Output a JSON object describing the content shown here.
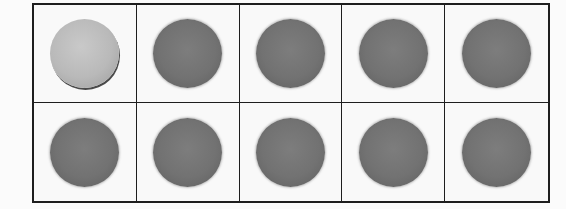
{
  "ten_frame": {
    "rows": 2,
    "columns": 5,
    "cells": [
      {
        "row": 1,
        "col": 1,
        "counter": "light"
      },
      {
        "row": 1,
        "col": 2,
        "counter": "dark"
      },
      {
        "row": 1,
        "col": 3,
        "counter": "dark"
      },
      {
        "row": 1,
        "col": 4,
        "counter": "dark"
      },
      {
        "row": 1,
        "col": 5,
        "counter": "dark"
      },
      {
        "row": 2,
        "col": 1,
        "counter": "dark"
      },
      {
        "row": 2,
        "col": 2,
        "counter": "dark"
      },
      {
        "row": 2,
        "col": 3,
        "counter": "dark"
      },
      {
        "row": 2,
        "col": 4,
        "counter": "dark"
      },
      {
        "row": 2,
        "col": 5,
        "counter": "dark"
      }
    ],
    "counts": {
      "light": 1,
      "dark": 9,
      "total": 10
    },
    "colors": {
      "grid_line": "#1e1e1e",
      "light_counter": "#b9b9b9",
      "dark_counter": "#707070",
      "background": "#fbfbfb"
    }
  }
}
